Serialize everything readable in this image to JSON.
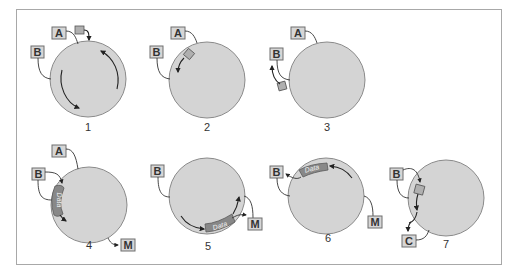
{
  "diagram": {
    "title": "",
    "colors": {
      "cell_fill": "#d4d4d4",
      "cell_stroke": "#8a8a8a",
      "tag_fill": "#d6d6d6",
      "band_fill": "#888888",
      "frame": "#a8a8a8"
    },
    "panels": [
      {
        "number": "1",
        "labels": [
          "A",
          "B"
        ],
        "note": "small token entering at top; two curved arrows circulating inside cell"
      },
      {
        "number": "2",
        "labels": [
          "A",
          "B"
        ],
        "note": "token on membrane moving toward B"
      },
      {
        "number": "3",
        "labels": [
          "A",
          "B"
        ],
        "note": "token exiting near B, arrow upward"
      },
      {
        "number": "4",
        "labels": [
          "A",
          "B",
          "M"
        ],
        "band_text": "Data",
        "note": "data band along left membrane; arrow to M"
      },
      {
        "number": "5",
        "labels": [
          "B",
          "M"
        ],
        "band_text": "Data",
        "note": "data band at bottom; arrows to M"
      },
      {
        "number": "6",
        "labels": [
          "B",
          "M"
        ],
        "band_text": "Data",
        "note": "data band at top; arrow to B"
      },
      {
        "number": "7",
        "labels": [
          "B",
          "C"
        ],
        "note": "token on left membrane moving from B toward C"
      }
    ],
    "band_label": "Data"
  }
}
